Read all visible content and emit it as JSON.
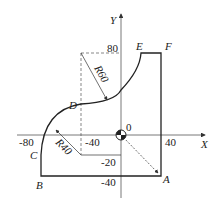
{
  "diagram": {
    "axes": {
      "x_label": "X",
      "y_label": "Y",
      "origin_label": "0"
    },
    "ticks": {
      "x": [
        "-80",
        "-40",
        "40"
      ],
      "y": [
        "80",
        "-20",
        "-40"
      ]
    },
    "points": {
      "A": "A",
      "B": "B",
      "C": "C",
      "D": "D",
      "E": "E",
      "F": "F"
    },
    "radii": {
      "r60": "R60",
      "r40": "R40"
    },
    "colors": {
      "line": "#222222",
      "axis": "#555555"
    }
  }
}
